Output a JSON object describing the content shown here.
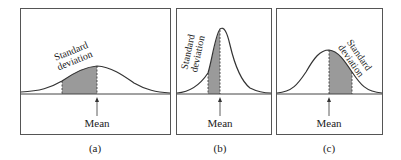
{
  "panels": [
    {
      "id": "a",
      "caption": "(a)",
      "sd_label_1": "Standard",
      "sd_label_2": "deviation",
      "mean_label": "Mean",
      "description": "wide, flat bell curve"
    },
    {
      "id": "b",
      "caption": "(b)",
      "sd_label_1": "Standard",
      "sd_label_2": "deviation",
      "mean_label": "Mean",
      "description": "narrow, tall bell curve"
    },
    {
      "id": "c",
      "caption": "(c)",
      "sd_label_1": "Standard",
      "sd_label_2": "deviation",
      "mean_label": "Mean",
      "description": "medium bell curve, shaded right of mean"
    }
  ],
  "colors": {
    "stroke": "#333333",
    "shade": "#9a9a9a",
    "frame": "#555555"
  }
}
